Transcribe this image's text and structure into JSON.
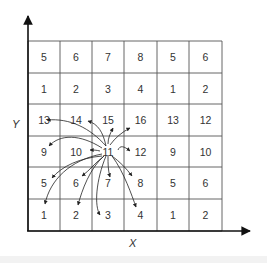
{
  "diagram": {
    "type": "grid-neighborhood",
    "axes": {
      "x_label": "X",
      "y_label": "Y"
    },
    "grid": {
      "rows": 6,
      "cols": 6,
      "cells": [
        [
          "5",
          "6",
          "7",
          "8",
          "5",
          "6"
        ],
        [
          "1",
          "2",
          "3",
          "4",
          "1",
          "2"
        ],
        [
          "13",
          "14",
          "15",
          "16",
          "13",
          "12"
        ],
        [
          "9",
          "10",
          "11",
          "12",
          "9",
          "10"
        ],
        [
          "5",
          "6",
          "7",
          "8",
          "5",
          "6"
        ],
        [
          "1",
          "2",
          "3",
          "4",
          "1",
          "2"
        ]
      ]
    },
    "center_cell": {
      "label": "11",
      "row": 3,
      "col": 2
    },
    "arrows_from_center_to": [
      "13",
      "14",
      "15",
      "16",
      "9",
      "10",
      "12",
      "5",
      "6",
      "7",
      "8",
      "1",
      "2",
      "3",
      "4"
    ],
    "colors": {
      "line": "#333333",
      "text": "#333333",
      "background": "#ffffff"
    }
  }
}
